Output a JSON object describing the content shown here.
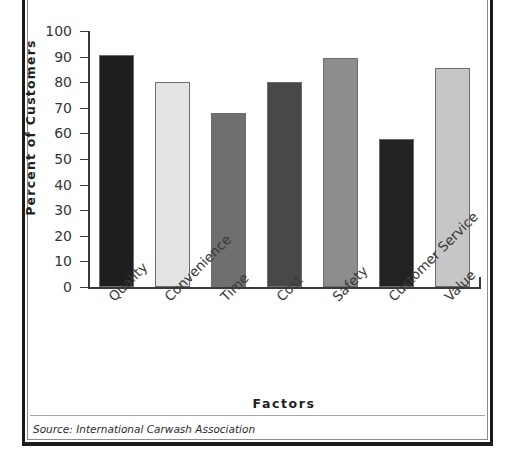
{
  "figure": {
    "source_note": "Source: International Carwash Association"
  },
  "chart_data": {
    "type": "bar",
    "title": "",
    "xlabel": "Factors",
    "ylabel": "Percent of Customers",
    "ylim": [
      0,
      100
    ],
    "ytick_labels": [
      "100",
      "90",
      "80",
      "70",
      "60",
      "50",
      "40",
      "30",
      "20",
      "10",
      "0"
    ],
    "ytick_values": [
      100,
      90,
      80,
      70,
      60,
      50,
      40,
      30,
      20,
      10,
      0
    ],
    "grid": false,
    "legend": "none",
    "categories": [
      "Quality",
      "Convenience",
      "Time",
      "Cost",
      "Safety",
      "Customer Service",
      "Value"
    ],
    "values": [
      90.5,
      80,
      68,
      80,
      89.5,
      58,
      85.5
    ],
    "bar_colors": [
      "#1e1e1e",
      "#e3e3e3",
      "#6f6f6f",
      "#484848",
      "#8d8d8d",
      "#222222",
      "#c6c6c6"
    ]
  }
}
